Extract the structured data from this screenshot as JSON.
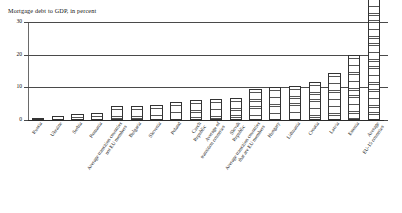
{
  "chart_data": {
    "type": "bar",
    "title": "Mortgage debt to GDP, in percent",
    "xlabel": "",
    "ylabel": "",
    "ylim": [
      0,
      30
    ],
    "yticks": [
      0,
      10,
      20,
      30
    ],
    "ytick_labels": [
      "0",
      "10",
      "20",
      "30"
    ],
    "grid": true,
    "legend": "none",
    "note": "Bars are hatched with horizontal lines; the final bar exceeds the plotted axis range and carries the data label 50.",
    "categories": [
      "Russia",
      "Ukraine",
      "Serbia",
      "Romania",
      "Average transition countries\nnot EU members",
      "Bulgaria",
      "Slovenia",
      "Poland",
      "Czech\nRepublic",
      "Average of\ntransition countries",
      "Slovak\nRepublic",
      "Average transition countries\nthat are EU members",
      "Hungary",
      "Lithuania",
      "Croatia",
      "Latvia",
      "Estonia",
      "Average\nEU-15 countries"
    ],
    "values": [
      0.5,
      1.1,
      1.8,
      2.1,
      4.3,
      4.4,
      4.6,
      5.4,
      6.2,
      6.5,
      6.8,
      9.5,
      10.2,
      10.4,
      11.5,
      14.5,
      20.0,
      50.0
    ],
    "value_labels": [
      "",
      "",
      "",
      "",
      "",
      "",
      "",
      "",
      "",
      "",
      "",
      "",
      "",
      "",
      "",
      "",
      "",
      "50"
    ]
  }
}
